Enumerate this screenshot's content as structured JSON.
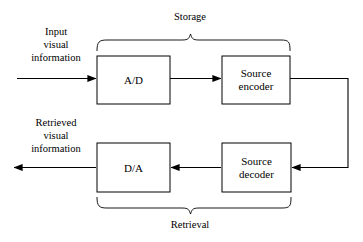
{
  "diagram": {
    "background_color": "#ffffff",
    "line_color": "#000000",
    "boxes": [
      {
        "id": "ad",
        "label_line1": "A/D",
        "label_line2": ""
      },
      {
        "id": "source-encoder",
        "label_line1": "Source",
        "label_line2": "encoder"
      },
      {
        "id": "da",
        "label_line1": "D/A",
        "label_line2": ""
      },
      {
        "id": "source-decoder",
        "label_line1": "Source",
        "label_line2": "decoder"
      }
    ],
    "input_label": {
      "line1": "Input",
      "line2": "visual",
      "line3": "information"
    },
    "output_label": {
      "line1": "Retrieved",
      "line2": "visual",
      "line3": "information"
    },
    "groups": [
      {
        "id": "storage",
        "label": "Storage"
      },
      {
        "id": "retrieval",
        "label": "Retrieval"
      }
    ]
  }
}
